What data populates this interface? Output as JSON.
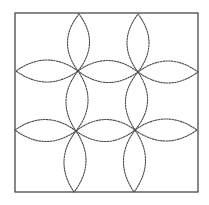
{
  "diagram": {
    "type": "quilting-stencil",
    "colors": {
      "background": "#ffffff",
      "frame": "#3a3a3a",
      "stitch_line": "#4a4a4a"
    },
    "frame": {
      "x1": 15,
      "y1": 13,
      "x2": 198,
      "y2": 192
    },
    "petal_half_width": 11,
    "flowers": [
      {
        "name": "top-left",
        "center": [
          78,
          71
        ],
        "tips": {
          "up": [
            79,
            14
          ],
          "right": [
            138,
            72
          ],
          "down": [
            76,
            131
          ],
          "left": [
            16,
            71
          ]
        }
      },
      {
        "name": "top-right",
        "center": [
          138,
          72
        ],
        "tips": {
          "up": [
            138,
            14
          ],
          "right": [
            198,
            72
          ],
          "down": [
            135,
            130
          ],
          "left": [
            78,
            71
          ]
        }
      },
      {
        "name": "bottom-left",
        "center": [
          76,
          131
        ],
        "tips": {
          "up": [
            78,
            71
          ],
          "right": [
            135,
            130
          ],
          "down": [
            74,
            192
          ],
          "left": [
            15,
            130
          ]
        }
      },
      {
        "name": "bottom-right",
        "center": [
          135,
          130
        ],
        "tips": {
          "up": [
            138,
            72
          ],
          "right": [
            197,
            130
          ],
          "down": [
            134,
            192
          ],
          "left": [
            76,
            131
          ]
        }
      }
    ]
  }
}
